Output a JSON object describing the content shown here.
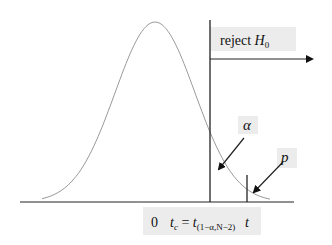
{
  "diagram": {
    "region_label": {
      "text": "reject ",
      "var": "H",
      "sub": "0"
    },
    "alpha_label": "α",
    "p_label": "p",
    "axis_labels": {
      "zero": "0",
      "tc_var": "t",
      "tc_sub": "c",
      "equals": " = ",
      "t_var": "t",
      "t_sub": "(1−α,N−2)",
      "t_stat": "t"
    },
    "colors": {
      "curve": "#9a9a9a",
      "lines": "#222222",
      "label_box": "#ececec"
    }
  }
}
